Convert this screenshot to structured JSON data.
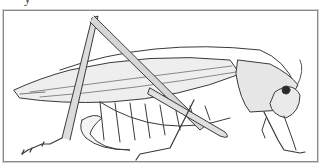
{
  "caption": {
    "partial_text": "y"
  },
  "illustration": {
    "subject": "katydid / grasshopper pencil drawing, side view facing right",
    "colors": {
      "frame": "#8a8a8a",
      "line": "#3a3a3a",
      "shade": "#9a9a9a",
      "background": "#ffffff"
    }
  }
}
